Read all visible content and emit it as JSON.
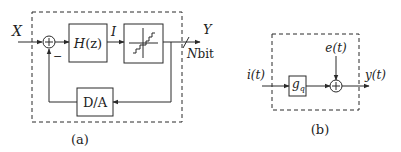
{
  "diagram_a": {
    "caption": "(a)",
    "input_label": "X",
    "output_label": "Y",
    "bus_width_label_N": "N",
    "bus_width_label_unit": "bit",
    "summing_sign_plus": "+",
    "summing_sign_minus": "−",
    "filter_block": {
      "label_main": "H",
      "label_arg": "(z)"
    },
    "filter_output_label": "I",
    "quantizer_block": {
      "icon": "staircase-quantizer-icon"
    },
    "dac_block": {
      "label": "D/A"
    }
  },
  "diagram_b": {
    "caption": "(b)",
    "input_label": "i(t)",
    "noise_label": "e(t)",
    "output_label": "y(t)",
    "gain_block": {
      "label_main": "g",
      "label_sub": "q"
    },
    "summing_sign_plus": "+"
  },
  "colors": {
    "line": "#2a2a2a",
    "background": "#ffffff"
  }
}
